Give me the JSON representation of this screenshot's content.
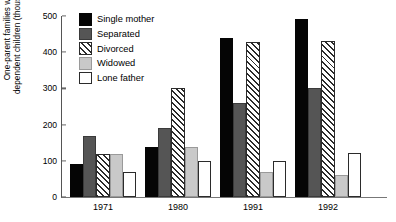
{
  "chart_data": {
    "type": "bar",
    "title": "",
    "xlabel": "",
    "ylabel": "One-parent families with dependent children (thousands)",
    "ylabel_line1": "One-parent families with",
    "ylabel_line2": "dependent children (thousands)",
    "categories": [
      "1971",
      "1980",
      "1991",
      "1992"
    ],
    "ylim": [
      0,
      500
    ],
    "yticks": [
      0,
      100,
      200,
      300,
      400,
      500
    ],
    "grid": false,
    "legend_position": "top-left-inside",
    "series": [
      {
        "name": "Single mother",
        "color": "#050505",
        "fill": "solid",
        "values": [
          90,
          138,
          440,
          492
        ]
      },
      {
        "name": "Separated",
        "color": "#555555",
        "fill": "solid",
        "values": [
          168,
          190,
          260,
          302
        ]
      },
      {
        "name": "Divorced",
        "color": "#ffffff",
        "fill": "diagonal-hatch",
        "values": [
          118,
          300,
          428,
          430
        ]
      },
      {
        "name": "Widowed",
        "color": "#c9c9c9",
        "fill": "solid",
        "values": [
          120,
          138,
          70,
          62
        ]
      },
      {
        "name": "Lone father",
        "color": "#ffffff",
        "fill": "empty",
        "values": [
          70,
          100,
          100,
          122
        ]
      }
    ]
  },
  "legend": {
    "items": [
      {
        "label": "Single mother"
      },
      {
        "label": "Separated"
      },
      {
        "label": "Divorced"
      },
      {
        "label": "Widowed"
      },
      {
        "label": "Lone father"
      }
    ]
  }
}
